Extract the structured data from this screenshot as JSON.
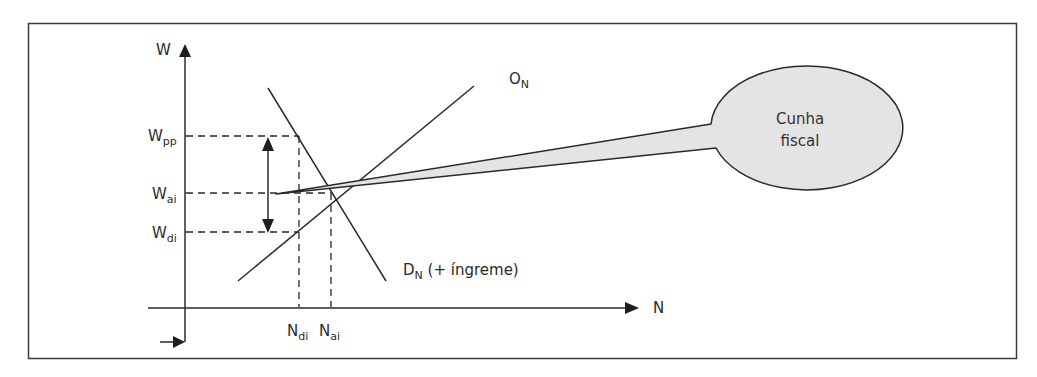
{
  "diagram": {
    "title": "",
    "colors": {
      "line": "#2a2a2a",
      "frame": "#3a3a3a",
      "bubble_fill": "#e4e4e4",
      "background": "#ffffff"
    },
    "axes": {
      "y": {
        "label": "W"
      },
      "x": {
        "label": "N"
      }
    },
    "y_labels": [
      {
        "main": "W",
        "sub": "pp"
      },
      {
        "main": "W",
        "sub": "ai"
      },
      {
        "main": "W",
        "sub": "di"
      }
    ],
    "x_labels": [
      {
        "main": "N",
        "sub": "di"
      },
      {
        "main": "N",
        "sub": "ai"
      }
    ],
    "curves": {
      "supply": {
        "main": "O",
        "sub": "N"
      },
      "demand": {
        "main": "D",
        "sub": "N",
        "suffix": " (+ íngreme)"
      }
    },
    "callout": {
      "line1": "Cunha",
      "line2": "fiscal"
    }
  }
}
